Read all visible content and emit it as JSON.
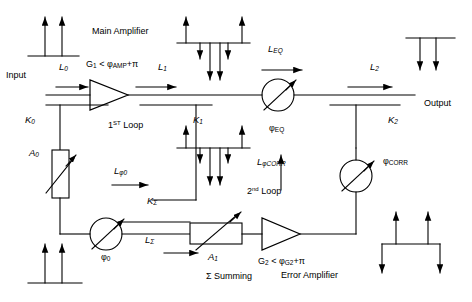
{
  "diagram": {
    "stroke_color": "#000000",
    "background_color": "#ffffff",
    "width": 472,
    "height": 302
  },
  "labels": {
    "input": "Input",
    "output": "Output",
    "main_amplifier": "Main Amplifier",
    "error_amplifier": "Error Amplifier",
    "sigma_summing": "Σ Summing",
    "first_loop_num": "1",
    "first_loop_sup": "ST",
    "first_loop_word": " Loop",
    "second_loop_num": "2",
    "second_loop_sup": "nd",
    "second_loop_word": " Loop",
    "gain1_main": "G",
    "gain1_sub": "1",
    "gain1_rest": " < φ",
    "gain1_sub2": "AMP",
    "gain1_tail": "+π",
    "gain2_main": "G",
    "gain2_sub": "2",
    "gain2_rest": " < φ",
    "gain2_sub2": "G2",
    "gain2_tail": "+π",
    "L0": "L",
    "L0_sub": "0",
    "L1": "L",
    "L1_sub": "1",
    "L2": "L",
    "L2_sub": "2",
    "LEQ": "L",
    "LEQ_sub": "EQ",
    "Lphi0": "L",
    "Lphi0_sub": "φ0",
    "Lsigma": "L",
    "Lsigma_sub": "Σ",
    "LphiCORR": "L",
    "LphiCORR_sub": "φCORR",
    "K0": "K",
    "K0_sub": "0",
    "K1": "K",
    "K1_sub": "1",
    "K2": "K",
    "K2_sub": "2",
    "Ksigma": "K",
    "Ksigma_sub": "Σ",
    "A0": "A",
    "A0_sub": "0",
    "A1": "A",
    "A1_sub": "1",
    "phi0": "φ",
    "phi0_sub": "0",
    "phiEQ": "φ",
    "phiEQ_sub": "EQ",
    "phiCORR": "φ",
    "phiCORR_sub": "CORR"
  },
  "components": [
    {
      "name": "main-amplifier-triangle",
      "type": "amplifier"
    },
    {
      "name": "error-amplifier-triangle",
      "type": "amplifier"
    },
    {
      "name": "attenuator-a0",
      "type": "variable-attenuator"
    },
    {
      "name": "attenuator-a1",
      "type": "variable-attenuator"
    },
    {
      "name": "phase-shifter-phi0",
      "type": "variable-phase-shifter"
    },
    {
      "name": "phase-shifter-phi-eq",
      "type": "variable-phase-shifter"
    },
    {
      "name": "phase-shifter-phi-corr",
      "type": "variable-phase-shifter"
    },
    {
      "name": "coupler-k0",
      "type": "directional-coupler"
    },
    {
      "name": "coupler-k1",
      "type": "directional-coupler"
    },
    {
      "name": "coupler-k2",
      "type": "directional-coupler"
    },
    {
      "name": "coupler-k-sigma",
      "type": "directional-coupler"
    }
  ],
  "spectra": [
    {
      "name": "spectrum-input",
      "carriers_up": 2,
      "distortion_down": 0
    },
    {
      "name": "spectrum-main-amp-output",
      "carriers_up": 2,
      "distortion_down": 4
    },
    {
      "name": "spectrum-output",
      "carriers_up": 0,
      "distortion_down": 2
    },
    {
      "name": "spectrum-coupler-k1-tap",
      "carriers_up": 2,
      "distortion_down": 4
    },
    {
      "name": "spectrum-sigma-input",
      "carriers_up": 2,
      "distortion_down": 0
    },
    {
      "name": "spectrum-error-amp-output",
      "carriers_up": 2,
      "distortion_down": 2
    }
  ]
}
